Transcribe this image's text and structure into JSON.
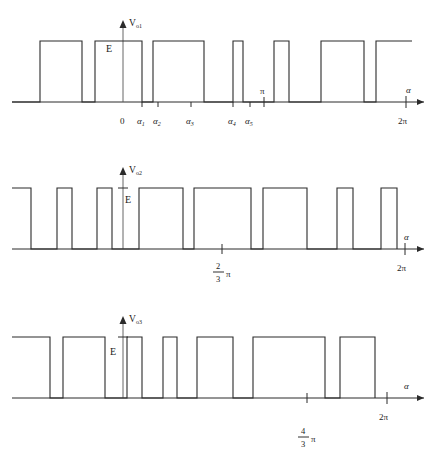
{
  "figure": {
    "background_color": "#ffffff",
    "stroke_color": "#2b2b2b",
    "width": 437,
    "height": 465
  },
  "chart_data": {
    "type": "line",
    "title": "",
    "xlabel": "α",
    "ylabel": "",
    "grid": false,
    "legend": "none",
    "xlim": [
      0,
      437
    ],
    "ylim": [
      0,
      1
    ],
    "series": [
      {
        "name": "Vo1",
        "amplitude_label": "E",
        "baseline_y": 102,
        "top_y": 41,
        "axis_x0": 12,
        "axis_x1": 424,
        "origin_x": 123,
        "pulses": [
          [
            40,
            82
          ],
          [
            95,
            142
          ],
          [
            153,
            204
          ],
          [
            233,
            243
          ],
          [
            274,
            289
          ],
          [
            321,
            364
          ],
          [
            376,
            412
          ]
        ]
      },
      {
        "name": "Vo2",
        "amplitude_label": "E",
        "baseline_y": 249,
        "top_y": 188,
        "axis_x0": 12,
        "axis_x1": 424,
        "origin_x": 123,
        "starts_high": true,
        "pulses": [
          [
            12,
            31
          ],
          [
            57,
            72
          ],
          [
            97,
            112
          ],
          [
            139,
            183
          ],
          [
            194,
            251
          ],
          [
            263,
            307
          ],
          [
            337,
            353
          ],
          [
            381,
            397
          ]
        ]
      },
      {
        "name": "Vo3",
        "amplitude_label": "E",
        "baseline_y": 398,
        "top_y": 337,
        "axis_x0": 12,
        "axis_x1": 424,
        "origin_x": 123,
        "starts_high": true,
        "pulses": [
          [
            12,
            50
          ],
          [
            63,
            105
          ],
          [
            127,
            142
          ],
          [
            163,
            177
          ],
          [
            197,
            233
          ],
          [
            253,
            325
          ],
          [
            340,
            375
          ]
        ]
      }
    ]
  },
  "plots": [
    {
      "id": "plot1",
      "y_axis_label_main": "V",
      "y_axis_label_sub": "o1",
      "amplitude_label": "E",
      "x_axis_label": "α",
      "ticks": [
        {
          "label": "0",
          "x": 123,
          "italic": false
        },
        {
          "label": "α",
          "sub": "1",
          "x": 142,
          "italic": true
        },
        {
          "label": "α",
          "sub": "2",
          "x": 158,
          "italic": true
        },
        {
          "label": "α",
          "sub": "3",
          "x": 191,
          "italic": true
        },
        {
          "label": "α",
          "sub": "4",
          "x": 233,
          "italic": true
        },
        {
          "label": "α",
          "sub": "5",
          "x": 250,
          "italic": true
        }
      ],
      "pi_tick": {
        "label": "π",
        "x": 264
      },
      "end_tick": {
        "label": "2π",
        "x": 406
      }
    },
    {
      "id": "plot2",
      "y_axis_label_main": "V",
      "y_axis_label_sub": "o2",
      "amplitude_label": "E",
      "x_axis_label": "α",
      "mid_tick": {
        "numerator": "2",
        "denominator": "3",
        "suffix": "π",
        "x": 222
      },
      "end_tick": {
        "label": "2π",
        "x": 405
      }
    },
    {
      "id": "plot3",
      "y_axis_label_main": "V",
      "y_axis_label_sub": "o3",
      "amplitude_label": "E",
      "x_axis_label": "α",
      "mid_tick": {
        "numerator": "4",
        "denominator": "3",
        "suffix": "π",
        "x": 307
      },
      "end_tick": {
        "label": "2π",
        "x": 387
      }
    }
  ]
}
